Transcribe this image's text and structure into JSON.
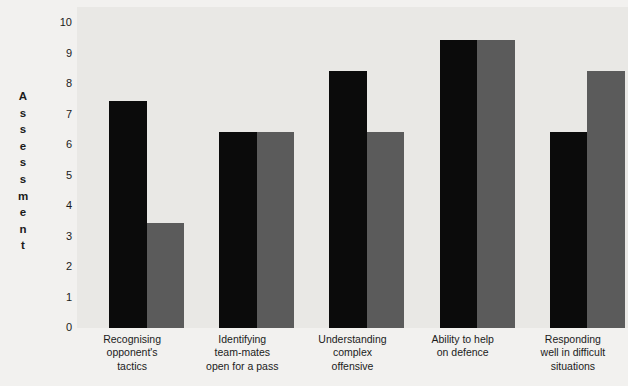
{
  "chart_data": {
    "type": "bar",
    "title": "",
    "xlabel": "",
    "ylabel": "Assessment",
    "ylim": [
      0,
      10
    ],
    "ytick_labels": [
      "10",
      "9",
      "8",
      "7",
      "6",
      "5",
      "4",
      "3",
      "2",
      "1",
      "0"
    ],
    "grid": false,
    "legend": "none",
    "categories": [
      "Recognising opponent's tactics",
      "Identifying team-mates open for a pass",
      "Understanding complex offensive",
      "Ability to help on defence",
      "Responding well in difficult situations"
    ],
    "category_lines": [
      [
        "Recognising",
        "opponent's",
        "tactics"
      ],
      [
        "Identifying",
        "team-mates",
        "open for a pass"
      ],
      [
        "Understanding",
        "complex",
        "offensive"
      ],
      [
        "Ability to help",
        "on defence"
      ],
      [
        "Responding",
        "well in difficult",
        "situations"
      ]
    ],
    "series": [
      {
        "name": "series-1",
        "color": "#0b0b0b",
        "values": [
          7.4,
          6.4,
          8.4,
          9.4,
          6.4
        ]
      },
      {
        "name": "series-2",
        "color": "#5b5b5b",
        "values": [
          3.4,
          6.4,
          6.4,
          9.4,
          8.4
        ]
      }
    ]
  },
  "colors": {
    "plot_background": "#e9e8e5",
    "page_background": "#f2f1ef",
    "text": "#1b1b1b"
  }
}
